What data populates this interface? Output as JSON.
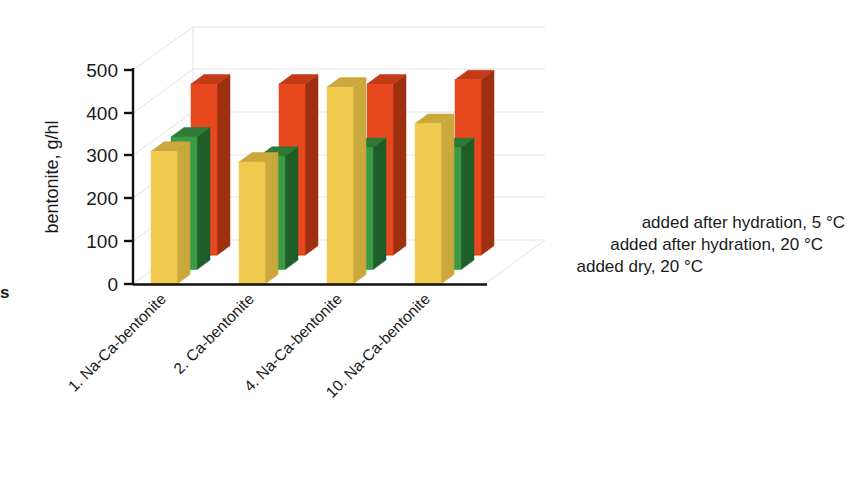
{
  "chart_data": {
    "type": "bar",
    "title": "",
    "subtitle": "",
    "xlabel": "",
    "ylabel": "bentonite, g/hl",
    "ylim": [
      0,
      500
    ],
    "yticks": [
      0,
      100,
      200,
      300,
      400,
      500
    ],
    "ytick_labels": [
      "0",
      "100",
      "200",
      "300",
      "400",
      "500"
    ],
    "grid": true,
    "three_d": true,
    "legend_position": "right",
    "categories": [
      "1. Na-Ca-bentonite",
      "2. Ca-bentonite",
      "4. Na-Ca-bentonite",
      "10. Na-Ca-bentonite"
    ],
    "series": [
      {
        "name": "added after hydration, 5 °C",
        "color": "#E8481E",
        "side_color": "#9E3010",
        "top_color": "#C23A16",
        "values": [
          400,
          400,
          400,
          410
        ]
      },
      {
        "name": "added after hydration, 20 °C",
        "color": "#3A9A45",
        "side_color": "#1E5C28",
        "top_color": "#2E7A35",
        "values": [
          310,
          265,
          285,
          285
        ]
      },
      {
        "name": "added dry, 20 °C",
        "color": "#F2CA50",
        "side_color": "#C9A83C",
        "top_color": "#C9A83C",
        "values": [
          310,
          285,
          460,
          375
        ]
      }
    ]
  },
  "legend": {
    "entries": [
      "added after hydration, 5 °C",
      "added after hydration, 20 °C",
      "added dry, 20 °C"
    ]
  },
  "edge_fragment": {
    "text": "s"
  }
}
